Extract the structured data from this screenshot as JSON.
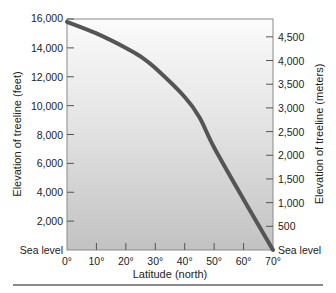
{
  "chart_data": {
    "type": "line",
    "title": "",
    "xlabel": "Latitude (north)",
    "ylabel": "Elevation of treeline (feet)",
    "ylabel_right": "Elevation of treeline (meters)",
    "xlim": [
      0,
      70
    ],
    "ylim": [
      0,
      16000
    ],
    "grid": false,
    "x_ticks": [
      "0°",
      "10°",
      "20°",
      "30°",
      "40°",
      "50°",
      "60°",
      "70°"
    ],
    "x_tick_values": [
      0,
      10,
      20,
      30,
      40,
      50,
      60,
      70
    ],
    "y_ticks_left": [
      "Sea level",
      "2,000",
      "4,000",
      "6,000",
      "8,000",
      "10,000",
      "12,000",
      "14,000",
      "16,000"
    ],
    "y_tick_values_left": [
      0,
      2000,
      4000,
      6000,
      8000,
      10000,
      12000,
      14000,
      16000
    ],
    "y_ticks_right": [
      "Sea level",
      "500",
      "1,000",
      "1,500",
      "2,000",
      "2,500",
      "3,000",
      "3,500",
      "4,000",
      "4,500"
    ],
    "y_tick_values_right_m": [
      0,
      500,
      1000,
      1500,
      2000,
      2500,
      3000,
      3500,
      4000,
      4500
    ],
    "series": [
      {
        "name": "Treeline elevation",
        "x": [
          0,
          10,
          20,
          25,
          30,
          40,
          45,
          50,
          60,
          70
        ],
        "values": [
          15800,
          15000,
          14000,
          13400,
          12600,
          10600,
          9200,
          7100,
          3500,
          0
        ]
      }
    ],
    "colors": {
      "line": "#555555",
      "plot_bg_top": "#fbfbfb",
      "plot_bg_bottom": "#c4c4c4"
    }
  }
}
